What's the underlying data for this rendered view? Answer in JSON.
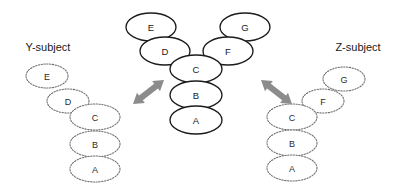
{
  "figure": {
    "background_color": "#ffffff",
    "main_node_stroke": "#1c1c1c",
    "side_node_stroke": "#6e6e6e",
    "arrow_color": "#8c8c8c"
  },
  "left_subject": {
    "title": "Y-subject",
    "nodes": [
      {
        "label": "E",
        "cx": 47,
        "cy": 76,
        "rx": 21,
        "ry": 12
      },
      {
        "label": "D",
        "cx": 68,
        "cy": 101,
        "rx": 21,
        "ry": 12
      },
      {
        "label": "C",
        "cx": 95,
        "cy": 117,
        "rx": 25,
        "ry": 13
      },
      {
        "label": "B",
        "cx": 95,
        "cy": 144,
        "rx": 25,
        "ry": 13
      },
      {
        "label": "A",
        "cx": 95,
        "cy": 169,
        "rx": 25,
        "ry": 13
      }
    ]
  },
  "center_subject": {
    "nodes": [
      {
        "label": "E",
        "cx": 151,
        "cy": 27,
        "rx": 25,
        "ry": 14
      },
      {
        "label": "D",
        "cx": 165,
        "cy": 51,
        "rx": 25,
        "ry": 14
      },
      {
        "label": "G",
        "cx": 245,
        "cy": 27,
        "rx": 25,
        "ry": 14
      },
      {
        "label": "F",
        "cx": 228,
        "cy": 51,
        "rx": 25,
        "ry": 14
      },
      {
        "label": "C",
        "cx": 196,
        "cy": 69,
        "rx": 26,
        "ry": 14
      },
      {
        "label": "B",
        "cx": 196,
        "cy": 95,
        "rx": 26,
        "ry": 14
      },
      {
        "label": "A",
        "cx": 196,
        "cy": 120,
        "rx": 26,
        "ry": 14
      }
    ]
  },
  "right_subject": {
    "title": "Z-subject",
    "nodes": [
      {
        "label": "G",
        "cx": 344,
        "cy": 79,
        "rx": 21,
        "ry": 12
      },
      {
        "label": "F",
        "cx": 323,
        "cy": 101,
        "rx": 21,
        "ry": 12
      },
      {
        "label": "C",
        "cx": 292,
        "cy": 117,
        "rx": 25,
        "ry": 13
      },
      {
        "label": "B",
        "cx": 292,
        "cy": 143,
        "rx": 25,
        "ry": 13
      },
      {
        "label": "A",
        "cx": 292,
        "cy": 168,
        "rx": 25,
        "ry": 13
      }
    ]
  },
  "titles": {
    "left_x": 48,
    "left_y": 47,
    "right_x": 358,
    "right_y": 47
  },
  "arrows": {
    "left": {
      "name": "left-double-arrow",
      "x1": 133,
      "y1": 104,
      "x2": 164,
      "y2": 80
    },
    "right": {
      "name": "right-double-arrow",
      "x1": 261,
      "y1": 80,
      "x2": 292,
      "y2": 104
    }
  }
}
